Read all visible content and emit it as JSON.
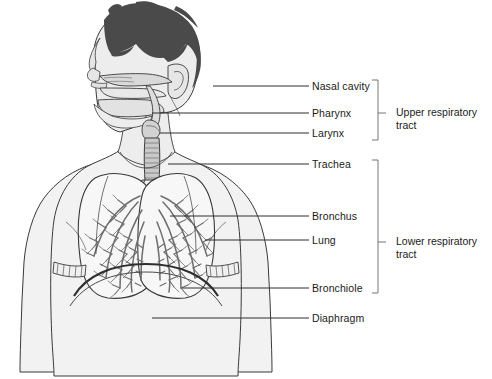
{
  "figure": {
    "background_color": "#ffffff",
    "line_color": "#333333",
    "hair_color": "#4a4a4a",
    "tissue_fill": "#efefef",
    "bronchi_color": "#6e6e6e"
  },
  "labels": [
    {
      "id": "nasal-cavity",
      "text": "Nasal cavity",
      "text_x": 312,
      "text_y": 80,
      "leader_x1": 213,
      "leader_y1": 86,
      "leader_x2": 309,
      "leader_y2": 86
    },
    {
      "id": "pharynx",
      "text": "Pharynx",
      "text_x": 312,
      "text_y": 107,
      "leader_x1": 152,
      "leader_y1": 113,
      "leader_x2": 309,
      "leader_y2": 113
    },
    {
      "id": "larynx",
      "text": "Larynx",
      "text_x": 312,
      "text_y": 127,
      "leader_x1": 160,
      "leader_y1": 133,
      "leader_x2": 309,
      "leader_y2": 133
    },
    {
      "id": "trachea",
      "text": "Trachea",
      "text_x": 312,
      "text_y": 158,
      "leader_x1": 168,
      "leader_y1": 164,
      "leader_x2": 309,
      "leader_y2": 164
    },
    {
      "id": "bronchus",
      "text": "Bronchus",
      "text_x": 312,
      "text_y": 210,
      "leader_x1": 170,
      "leader_y1": 216,
      "leader_x2": 309,
      "leader_y2": 216
    },
    {
      "id": "lung",
      "text": "Lung",
      "text_x": 312,
      "text_y": 234,
      "leader_x1": 205,
      "leader_y1": 240,
      "leader_x2": 309,
      "leader_y2": 240
    },
    {
      "id": "bronchiole",
      "text": "Bronchiole",
      "text_x": 312,
      "text_y": 282,
      "leader_x1": 182,
      "leader_y1": 288,
      "leader_x2": 309,
      "leader_y2": 288
    },
    {
      "id": "diaphragm",
      "text": "Diaphragm",
      "text_x": 312,
      "text_y": 312,
      "leader_x1": 152,
      "leader_y1": 318,
      "leader_x2": 309,
      "leader_y2": 318
    }
  ],
  "groups": [
    {
      "id": "upper-respiratory-tract",
      "line1": "Upper respiratory",
      "line2": "tract",
      "text_x": 396,
      "text_y": 106,
      "bracket_x": 378,
      "bracket_top": 80,
      "bracket_bottom": 140,
      "tick_y": 113
    },
    {
      "id": "lower-respiratory-tract",
      "line1": "Lower respiratory",
      "line2": "tract",
      "text_x": 396,
      "text_y": 235,
      "bracket_x": 378,
      "bracket_top": 160,
      "bracket_bottom": 293,
      "tick_y": 242
    }
  ]
}
